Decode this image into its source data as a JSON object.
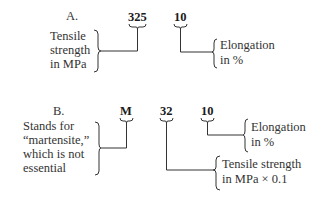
{
  "section_a": {
    "heading": "A.",
    "code_parts": [
      "325",
      "10"
    ],
    "label_tensile": [
      "Tensile",
      "strength",
      "in MPa"
    ],
    "label_elongation": [
      "Elongation",
      "in %"
    ]
  },
  "section_b": {
    "heading": "B.",
    "code_parts": [
      "M",
      "32",
      "10"
    ],
    "label_martensite": [
      "Stands for",
      "“martensite,”",
      "which is not",
      "essential"
    ],
    "label_elongation": [
      "Elongation",
      "in %"
    ],
    "label_tensile": [
      "Tensile strength",
      "in MPa × 0.1"
    ]
  }
}
